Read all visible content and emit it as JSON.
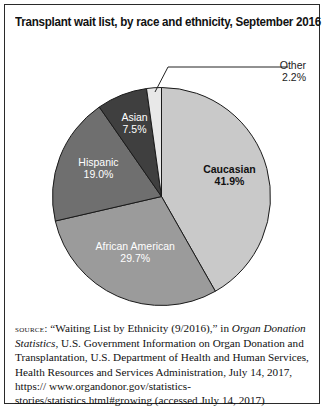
{
  "chart_data": {
    "type": "pie",
    "title": "Transplant wait list, by race and ethnicity, September 2016",
    "categories": [
      "Caucasian",
      "African American",
      "Hispanic",
      "Asian",
      "Other"
    ],
    "values": [
      41.9,
      29.7,
      19.0,
      7.5,
      2.2
    ],
    "labels": [
      "41.9%",
      "29.7%",
      "19.0%",
      "7.5%",
      "2.2%"
    ],
    "colors": [
      "#c9c9c9",
      "#9b9b9b",
      "#6f6f6f",
      "#3f3f3f",
      "#e8e8e8"
    ],
    "start_angle": "12 o'clock, clockwise",
    "legend": "none (direct labels)"
  },
  "source": {
    "label": "source:",
    "pre": " “Waiting List by Ethnicity (9/2016),” in ",
    "italic": "Organ Donation Statistics",
    "post": ", U.S. Government Information on Organ Donation and Transplantation, U.S. Department of Health and Human Services, Health Resources and Services Administration, July 14, 2017, https:// www.organdonor.gov/statistics-stories/statistics.html#growing (accessed July 14, 2017)"
  }
}
